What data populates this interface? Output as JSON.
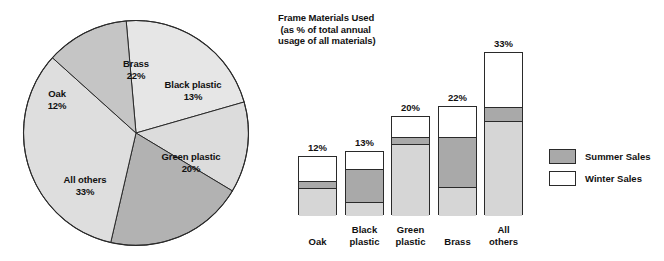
{
  "chart_data": [
    {
      "type": "pie",
      "title": "",
      "categories": [
        "Brass",
        "Black plastic",
        "Green plastic",
        "All others",
        "Oak"
      ],
      "values": [
        22,
        13,
        20,
        33,
        12
      ],
      "value_suffix": "%",
      "slices": [
        {
          "label": "Brass",
          "value": 22,
          "value_text": "22%",
          "color": "#e6e6e6",
          "start_deg": 265,
          "end_deg": 344
        },
        {
          "label": "Black plastic",
          "value": 13,
          "value_text": "13%",
          "color": "#dcdcdc",
          "start_deg": 344,
          "end_deg": 31
        },
        {
          "label": "Green plastic",
          "value": 20,
          "value_text": "20%",
          "color": "#b2b2b2",
          "start_deg": 31,
          "end_deg": 103
        },
        {
          "label": "All others",
          "value": 33,
          "value_text": "33%",
          "color": "#dedede",
          "start_deg": 103,
          "end_deg": 222
        },
        {
          "label": "Oak",
          "value": 12,
          "value_text": "12%",
          "color": "#c5c5c5",
          "start_deg": 222,
          "end_deg": 265
        }
      ],
      "legend": "none",
      "grid": false
    },
    {
      "type": "bar",
      "subtype": "stacked",
      "title": "Frame Materials Used\n (as % of total annual\nusage of all materials)",
      "title_lines": [
        "Frame Materials Used",
        " (as % of total annual",
        "usage of all materials)"
      ],
      "xlabel": "",
      "ylabel": "",
      "ylim": [
        0,
        33
      ],
      "grid": false,
      "legend_position": "right",
      "categories": [
        "Oak",
        "Black\nplastic",
        "Green\nplastic",
        "Brass",
        "All\nothers"
      ],
      "totals": [
        12,
        13,
        20,
        22,
        33
      ],
      "total_labels": [
        "12%",
        "13%",
        "20%",
        "22%",
        "33%"
      ],
      "series": [
        {
          "name": "Winter Sales",
          "color": "#ffffff",
          "values": [
            5.0,
            3.5,
            4.0,
            6.0,
            11.0
          ]
        },
        {
          "name": "Summer Sales",
          "color": "#a9a9a9",
          "values": [
            1.5,
            6.8,
            1.6,
            10.4,
            3.0
          ]
        },
        {
          "name": "Base",
          "color": "#d6d6d6",
          "values": [
            5.5,
            2.7,
            14.4,
            5.6,
            19.0
          ]
        }
      ],
      "bars": [
        {
          "category": "Oak",
          "label": "Oak",
          "total": 12,
          "total_label": "12%",
          "winter": 5.0,
          "summer": 1.5,
          "base": 5.5
        },
        {
          "category": "Black plastic",
          "label": "Black\nplastic",
          "total": 13,
          "total_label": "13%",
          "winter": 3.5,
          "summer": 6.8,
          "base": 2.7
        },
        {
          "category": "Green plastic",
          "label": "Green\nplastic",
          "total": 20,
          "total_label": "20%",
          "winter": 4.0,
          "summer": 1.6,
          "base": 14.4
        },
        {
          "category": "Brass",
          "label": "Brass",
          "total": 22,
          "total_label": "22%",
          "winter": 6.0,
          "summer": 10.4,
          "base": 5.6
        },
        {
          "category": "All others",
          "label": "All\nothers",
          "total": 33,
          "total_label": "33%",
          "winter": 11.0,
          "summer": 3.0,
          "base": 19.0
        }
      ],
      "legend_entries": [
        {
          "label": "Summer Sales",
          "color": "#a9a9a9"
        },
        {
          "label": "Winter Sales",
          "color": "#ffffff"
        }
      ]
    }
  ],
  "colors": {
    "outline": "#2a2a2a",
    "summer": "#a9a9a9",
    "winter": "#ffffff",
    "base": "#d6d6d6",
    "background": "#ffffff"
  }
}
